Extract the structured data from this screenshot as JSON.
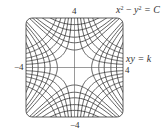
{
  "figure": {
    "type": "orthogonal-trajectories-plot",
    "window": {
      "xmin": -4,
      "xmax": 4,
      "ymin": -4,
      "ymax": 4
    },
    "families": [
      {
        "name": "x2-minus-y2",
        "equation_display": "x² − y² = C",
        "constants": [
          -12,
          -9,
          -6,
          -4,
          -2,
          2,
          4,
          6,
          9,
          12
        ]
      },
      {
        "name": "xy",
        "equation_display": "xy = k",
        "constants": [
          -6,
          -4.5,
          -3,
          -2,
          -1,
          1,
          2,
          3,
          4.5,
          6
        ]
      }
    ],
    "line_color": "#2b2b2b",
    "axis_color": "#555555"
  },
  "labels": {
    "top_tick": "4",
    "left_tick": "−4",
    "right_tick": "4",
    "bottom_tick": "−4",
    "family1_x": "x",
    "family1_exp1": "2",
    "family1_mid": " − ",
    "family1_y": "y",
    "family1_exp2": "2",
    "family1_rhs": " = C",
    "family2": "xy = k"
  }
}
